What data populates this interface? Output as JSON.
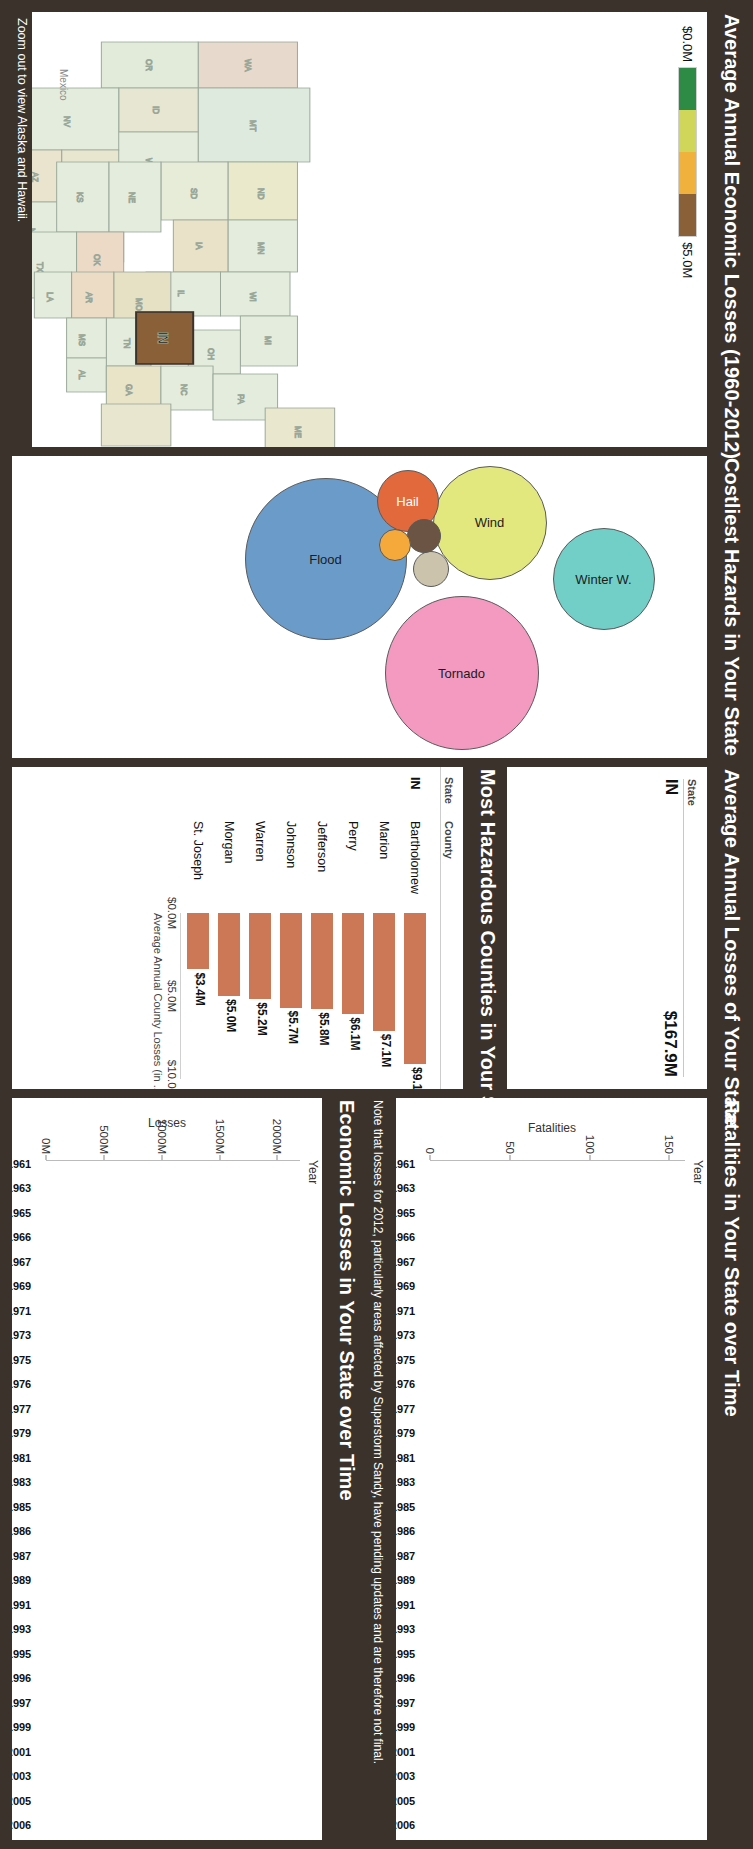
{
  "panels": {
    "map_title": "Average Annual Economic Losses (1960-2012)",
    "bubble_title": "Costliest Hazards in Your State",
    "state_title": "Average Annual Losses of Your State",
    "county_title": "Most Hazardous Counties in Your State",
    "fatalities_title": "Fatalities in Your State over Time",
    "losses_title": "Economic Losses in Your State over Time"
  },
  "map": {
    "legend_min": "$0.0M",
    "legend_max": "$5.0M",
    "legend_colors": [
      "#2e8b45",
      "#cfd65a",
      "#f0b23c",
      "#8a6038"
    ],
    "zoom_note": "Zoom out to view Alaska and Hawaii.",
    "mexico_label": "Mexico",
    "selected_state": "IN"
  },
  "state_table": {
    "header_state": "State",
    "state": "IN",
    "value": "$167.9M"
  },
  "county_table": {
    "header_state": "State",
    "header_county": "County",
    "state": "IN",
    "axis_title": "Average Annual County Losses (in ..",
    "axis_ticks": [
      "$0.0M",
      "$5.0M",
      "$10.0M"
    ]
  },
  "note": "Note that losses for 2012, particularly areas affected by Superstorm Sandy, have pending updates and are therefore not final.",
  "chart_data": [
    {
      "type": "bar",
      "name": "most-hazardous-counties",
      "title": "Most Hazardous Counties in Your State",
      "xlabel": "Average Annual County Losses (in ..",
      "ylabel": "County",
      "xlim": [
        0,
        10
      ],
      "categories": [
        "Bartholomew",
        "Marion",
        "Perry",
        "Jefferson",
        "Johnson",
        "Warren",
        "Morgan",
        "St. Joseph"
      ],
      "values": [
        9.1,
        7.1,
        6.1,
        5.8,
        5.7,
        5.2,
        5.0,
        3.4
      ],
      "labels": [
        "$9.1M",
        "$7.1M",
        "$6.1M",
        "$5.8M",
        "$5.7M",
        "$5.2M",
        "$5.0M",
        "$3.4M"
      ],
      "color": "#cc7755"
    },
    {
      "type": "bubble",
      "name": "costliest-hazards",
      "title": "Costliest Hazards in Your State",
      "bubbles": [
        {
          "label": "Flood",
          "value": 100,
          "color": "#6a9bc9"
        },
        {
          "label": "Tornado",
          "value": 96,
          "color": "#f49ac1"
        },
        {
          "label": "Wind",
          "value": 72,
          "color": "#e3e87e"
        },
        {
          "label": "Winter W.",
          "value": 63,
          "color": "#71cfc8"
        },
        {
          "label": "Hail",
          "value": 38,
          "color": "#e2693c"
        },
        {
          "label": "",
          "value": 22,
          "color": "#cbc3ab"
        },
        {
          "label": "",
          "value": 20,
          "color": "#6b5443"
        },
        {
          "label": "",
          "value": 18,
          "color": "#f6a93b"
        }
      ]
    },
    {
      "type": "bar",
      "name": "fatalities-over-time",
      "title": "Fatalities in Your State over Time",
      "xlabel": "Year",
      "ylabel": "Fatalities",
      "ylim": [
        0,
        160
      ],
      "yticks": [
        0,
        50,
        100,
        150
      ],
      "ytick_labels": [
        "0",
        "50",
        "100",
        "150"
      ],
      "color": "#4a7ebb",
      "categories": [
        "1960",
        "1961",
        "1962",
        "1963",
        "1964",
        "1965",
        "1966",
        "1967",
        "1968",
        "1969",
        "1970",
        "1971",
        "1972",
        "1973",
        "1974",
        "1975",
        "1976",
        "1977",
        "1978",
        "1979",
        "1980",
        "1981",
        "1982",
        "1983",
        "1984",
        "1985",
        "1986",
        "1987",
        "1988",
        "1989",
        "1990",
        "1991",
        "1992",
        "1993",
        "1994",
        "1995",
        "1996",
        "1997",
        "1998",
        "1999",
        "2000",
        "2001",
        "2002",
        "2003",
        "2004",
        "2005",
        "2006",
        "2007",
        "2008",
        "2009",
        "2010",
        "2011",
        "2012"
      ],
      "tick_labels": [
        "",
        "1961",
        "",
        "1963",
        "",
        "1965",
        "1966",
        "1967",
        "",
        "1969",
        "",
        "1971",
        "",
        "1973",
        "",
        "1975",
        "1976",
        "1977",
        "",
        "1979",
        "",
        "1981",
        "",
        "1983",
        "",
        "1985",
        "1986",
        "1987",
        "",
        "1989",
        "",
        "1991",
        "",
        "1993",
        "",
        "1995",
        "1996",
        "1997",
        "",
        "1999",
        "",
        "2001",
        "",
        "2003",
        "",
        "2005",
        "2006",
        "2007",
        "",
        "2009",
        "",
        "2011",
        ""
      ],
      "values": [
        2,
        1,
        3,
        12,
        2,
        1,
        148,
        1,
        2,
        6,
        5,
        9,
        4,
        11,
        4,
        88,
        9,
        15,
        17,
        17,
        14,
        3,
        8,
        13,
        4,
        6,
        25,
        5,
        5,
        22,
        5,
        12,
        2,
        8,
        3,
        10,
        30,
        2,
        13,
        11,
        10,
        12,
        4,
        3,
        3,
        5,
        25,
        3,
        27,
        4,
        6,
        12,
        13
      ]
    },
    {
      "type": "bar",
      "name": "economic-losses-over-time",
      "title": "Economic Losses in Your State over Time",
      "xlabel": "Year",
      "ylabel": "Losses",
      "ylim": [
        0,
        2200
      ],
      "yticks": [
        0,
        500,
        1000,
        1500,
        2000
      ],
      "ytick_labels": [
        "0M",
        "500M",
        "1000M",
        "1500M",
        "2000M"
      ],
      "color": "#f4a14a",
      "categories": [
        "1960",
        "1961",
        "1962",
        "1963",
        "1964",
        "1965",
        "1966",
        "1967",
        "1968",
        "1969",
        "1970",
        "1971",
        "1972",
        "1973",
        "1974",
        "1975",
        "1976",
        "1977",
        "1978",
        "1979",
        "1980",
        "1981",
        "1982",
        "1983",
        "1984",
        "1985",
        "1986",
        "1987",
        "1988",
        "1989",
        "1990",
        "1991",
        "1992",
        "1993",
        "1994",
        "1995",
        "1996",
        "1997",
        "1998",
        "1999",
        "2000",
        "2001",
        "2002",
        "2003",
        "2004",
        "2005",
        "2006",
        "2007",
        "2008",
        "2009",
        "2010",
        "2011",
        "2012"
      ],
      "tick_labels": [
        "",
        "1961",
        "",
        "1963",
        "",
        "1965",
        "1966",
        "1967",
        "",
        "1969",
        "",
        "1971",
        "",
        "1973",
        "",
        "1975",
        "1976",
        "1977",
        "",
        "1979",
        "",
        "1981",
        "",
        "1983",
        "",
        "1985",
        "1986",
        "1987",
        "",
        "1989",
        "",
        "1991",
        "",
        "1993",
        "",
        "1995",
        "1996",
        "1997",
        "",
        "1999",
        "",
        "2001",
        "",
        "2003",
        "",
        "2005",
        "2006",
        "2007",
        "",
        "2009",
        "",
        "2011",
        ""
      ],
      "values": [
        5,
        10,
        5,
        15,
        5,
        8,
        750,
        40,
        5,
        5,
        5,
        20,
        10,
        1500,
        5,
        10,
        8,
        2100,
        40,
        30,
        90,
        210,
        130,
        40,
        10,
        8,
        20,
        12,
        15,
        60,
        260,
        300,
        40,
        140,
        15,
        20,
        35,
        150,
        60,
        70,
        30,
        110,
        60,
        430,
        350,
        70,
        160,
        1620,
        30,
        45,
        18,
        60,
        10
      ]
    }
  ]
}
